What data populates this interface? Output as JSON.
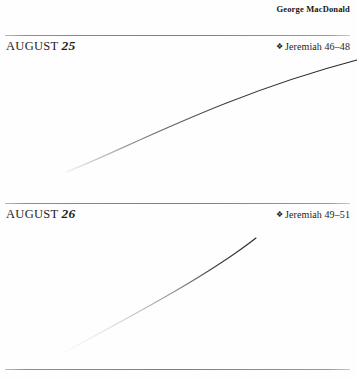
{
  "page": {
    "background_color": "#fefefe",
    "rule_color": "#7e7e7e",
    "text_color": "#1d1d1d"
  },
  "running_head": {
    "author": "George MacDonald"
  },
  "entries": [
    {
      "month": "AUGUST",
      "day": "25",
      "bullet": "❖",
      "bullet_icon_name": "floret-bullet-icon",
      "reading": "Jeremiah 46–48"
    },
    {
      "month": "AUGUST",
      "day": "26",
      "bullet": "❖",
      "bullet_icon_name": "floret-bullet-icon",
      "reading": "Jeremiah 49–51"
    }
  ],
  "rules": [
    {
      "name": "rule-above-august-25"
    },
    {
      "name": "rule-above-august-26"
    },
    {
      "name": "rule-page-bottom"
    }
  ]
}
